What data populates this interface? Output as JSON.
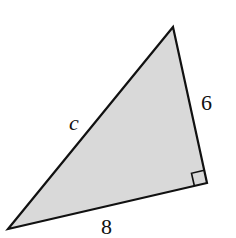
{
  "figure": {
    "type": "right-triangle",
    "fill_color": "#d9d9d9",
    "stroke_color": "#111111",
    "vertices": {
      "top": [
        173,
        27
      ],
      "right_angle": [
        207,
        183
      ],
      "bottom_left": [
        8,
        229
      ]
    },
    "right_angle_marker": {
      "at": "right_angle",
      "size": 13
    },
    "labels": {
      "hypotenuse": "c",
      "vertical_leg": "6",
      "bottom_leg": "8"
    }
  }
}
